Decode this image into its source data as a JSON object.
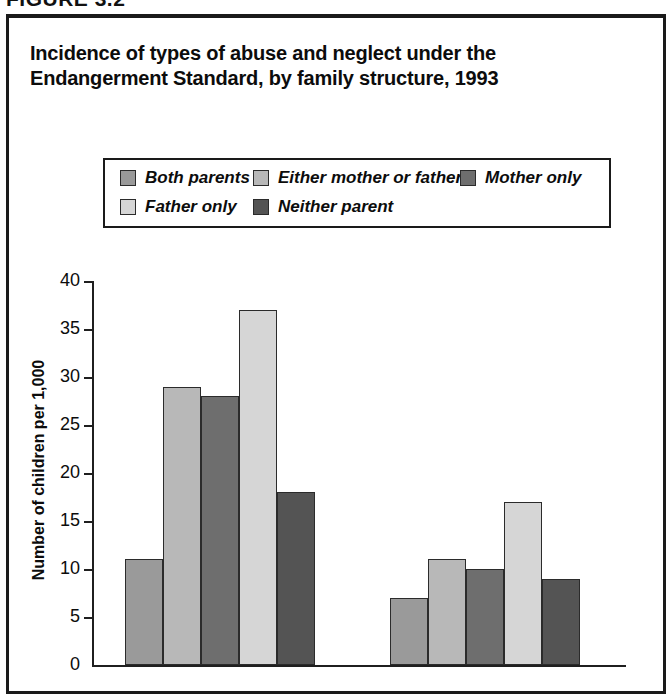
{
  "figure": {
    "label": "FIGURE 3.2"
  },
  "title": {
    "line1": "Incidence of types of abuse and neglect under the",
    "line2": "Endangerment Standard, by family structure, 1993"
  },
  "legend": {
    "rows": [
      [
        {
          "label": "Both parents",
          "color": "#9a9a9a",
          "left": 15,
          "swatch_left": 15
        },
        {
          "label": "Either mother or father",
          "color": "#b8b8b8",
          "left": 148
        },
        {
          "label": "Mother only",
          "color": "#6e6e6e",
          "left": 355
        }
      ],
      [
        {
          "label": "Father only",
          "color": "#d6d6d6",
          "left": 15
        },
        {
          "label": "Neither parent",
          "color": "#545454",
          "left": 148
        }
      ]
    ]
  },
  "axes": {
    "y_title": "Number of children per 1,000",
    "y_ticks": [
      "40",
      "35",
      "30",
      "25",
      "20",
      "15",
      "10",
      "5",
      "0"
    ]
  },
  "chart_data": {
    "type": "bar",
    "title": "Incidence of types of abuse and neglect under the Endangerment Standard, by family structure, 1993",
    "xlabel": "",
    "ylabel": "Number of children per 1,000",
    "ylim": [
      0,
      40
    ],
    "ytick_step": 5,
    "grid": false,
    "legend_position": "top",
    "categories": [
      "Group 1",
      "Group 2"
    ],
    "series": [
      {
        "name": "Both parents",
        "color": "#9a9a9a",
        "values": [
          11,
          7
        ]
      },
      {
        "name": "Either mother or father",
        "color": "#b8b8b8",
        "values": [
          29,
          11
        ]
      },
      {
        "name": "Mother only",
        "color": "#6e6e6e",
        "values": [
          28,
          10
        ]
      },
      {
        "name": "Father only",
        "color": "#d6d6d6",
        "values": [
          37,
          17
        ]
      },
      {
        "name": "Neither parent",
        "color": "#545454",
        "values": [
          18,
          9
        ]
      }
    ]
  },
  "geometry": {
    "baseline_y": 665,
    "px_per_unit": 9.6,
    "bar_width": 38,
    "group_starts": [
      125,
      390
    ],
    "bar_pitch": 38
  }
}
